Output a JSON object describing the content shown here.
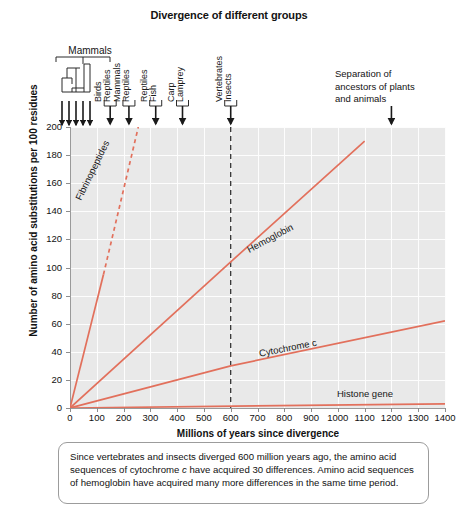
{
  "chart_data": {
    "type": "line",
    "title": "Divergence of different groups",
    "xlabel": "Millions of years since divergence",
    "ylabel": "Number of amino acid substitutions per 100 residues",
    "xlim": [
      0,
      1400
    ],
    "ylim": [
      0,
      200
    ],
    "grid": true,
    "legend_position": "inline-labels",
    "xticks": [
      0,
      100,
      200,
      300,
      400,
      500,
      600,
      700,
      800,
      900,
      1000,
      1100,
      1200,
      1300,
      1400
    ],
    "yticks": [
      0,
      20,
      40,
      60,
      80,
      100,
      120,
      140,
      160,
      180,
      200
    ],
    "series": [
      {
        "name": "Fibrinopeptides",
        "color": "#e2705c",
        "style": "solid-then-dashed",
        "x": [
          0,
          125,
          255
        ],
        "y": [
          0,
          95,
          200
        ],
        "note": "Steepest slope; solid to ~125 Myr then dashed to top of axis"
      },
      {
        "name": "Hemoglobin",
        "color": "#e2705c",
        "style": "solid",
        "x": [
          0,
          600,
          1100
        ],
        "y": [
          0,
          104,
          190
        ],
        "note": "Passes ~104 substitutions at the 600 Myr divergence line"
      },
      {
        "name": "Cytochrome c",
        "color": "#e2705c",
        "style": "solid",
        "x": [
          0,
          600,
          1400
        ],
        "y": [
          0,
          30,
          62
        ],
        "note": "30 differences at 600 Myr vertebrate-insect divergence"
      },
      {
        "name": "Histone gene",
        "color": "#e2705c",
        "style": "solid",
        "x": [
          0,
          1400
        ],
        "y": [
          0,
          3
        ],
        "note": "Nearly flat; very slow rate of change"
      }
    ],
    "divergence_markers": [
      {
        "x": 150,
        "labels": [
          "Birds",
          "Reptiles"
        ]
      },
      {
        "x": 220,
        "labels": [
          "Mammals",
          "Reptiles"
        ]
      },
      {
        "x": 320,
        "labels": [
          "Reptiles",
          "Fish"
        ]
      },
      {
        "x": 420,
        "labels": [
          "Carp",
          "Lamprey"
        ]
      },
      {
        "x": 600,
        "labels": [
          "Vertebrates",
          "Insects"
        ],
        "dashed_vertical": true
      }
    ],
    "annotations": [
      {
        "name": "mammals-tree",
        "text": "Mammals",
        "x": 0,
        "tips": 5
      },
      {
        "name": "separation-note",
        "text": "Separation of ancestors of plants and animals",
        "x": 1200
      }
    ]
  },
  "labels": {
    "mammals": "Mammals",
    "separation_line1": "Separation of",
    "separation_line2": "ancestors of plants",
    "separation_line3": "and animals"
  },
  "caption": {
    "part1": "Since vertebrates and insects diverged 600 million years ago, the amino acid sequences of cytochrome ",
    "italic": "c",
    "part2": " have acquired 30 differences. Amino acid sequences of hemoglobin have acquired many more differences in the same time period."
  }
}
